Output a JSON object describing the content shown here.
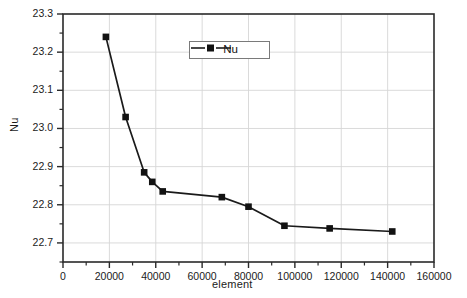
{
  "chart_data": {
    "type": "line",
    "title": "",
    "xlabel": "element",
    "ylabel": "Nu",
    "xlim": [
      0,
      160000
    ],
    "ylim": [
      22.65,
      23.3
    ],
    "xticks": [
      0,
      20000,
      40000,
      60000,
      80000,
      100000,
      120000,
      140000,
      160000
    ],
    "xtick_labels": [
      "0",
      "20000",
      "40000",
      "60000",
      "80000",
      "100000",
      "120000",
      "140000",
      "160000"
    ],
    "yticks": [
      22.7,
      22.8,
      22.9,
      23.0,
      23.1,
      23.2,
      23.3
    ],
    "ytick_labels": [
      "22.7",
      "22.8",
      "22.9",
      "23.0",
      "23.1",
      "23.2",
      "23.3"
    ],
    "grid": true,
    "legend_position": "upper-center",
    "marker": "square",
    "line_color": "#1a1a1a",
    "marker_color": "#121212",
    "grid_color": "#d6d6d6",
    "axis_color": "#2a2a2a",
    "series": [
      {
        "name": "Nu",
        "x": [
          18500,
          27000,
          35000,
          38500,
          43000,
          68500,
          80000,
          95500,
          115000,
          142000
        ],
        "values": [
          23.24,
          23.03,
          22.885,
          22.86,
          22.835,
          22.82,
          22.795,
          22.745,
          22.738,
          22.73
        ]
      }
    ]
  },
  "legend": {
    "entries": [
      {
        "label": "Nu"
      }
    ]
  }
}
